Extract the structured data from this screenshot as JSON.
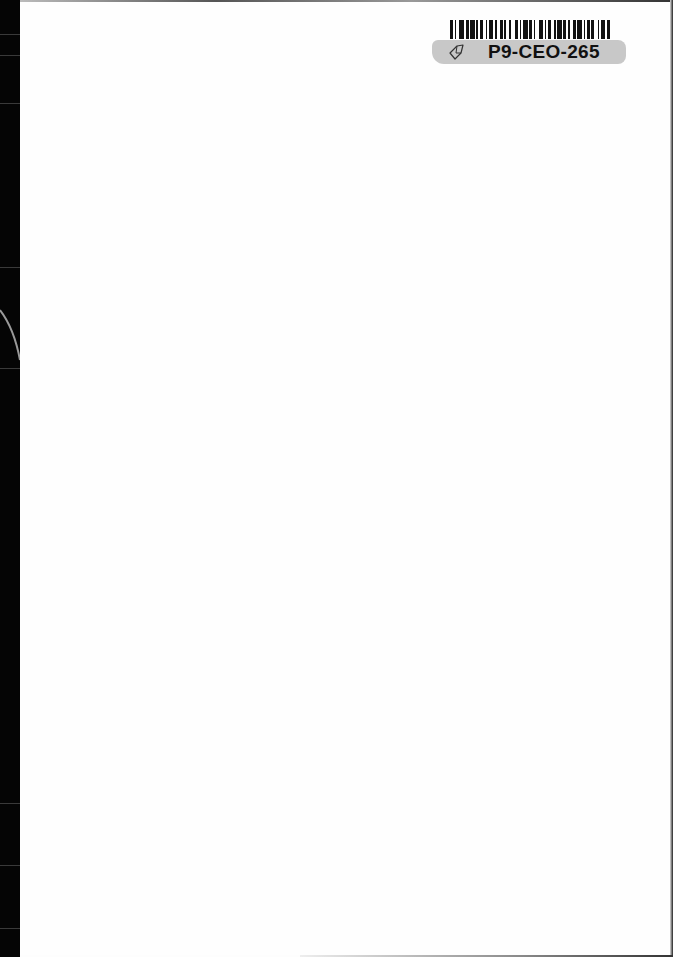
{
  "document": {
    "type": "scanned-blank-page",
    "page_color": "#fefefe",
    "binding_color": "#050505"
  },
  "library_label": {
    "icon": "tag-icon",
    "call_number": "P9-CEO-265",
    "label_color": "#c8c8c8",
    "barcode_pattern": [
      2,
      1,
      1,
      2,
      3,
      1,
      2,
      1,
      3,
      1,
      1,
      1,
      2,
      2,
      1,
      1,
      3,
      1,
      1,
      2,
      2,
      1,
      1,
      2,
      1,
      3,
      2,
      1,
      1,
      1,
      3,
      1,
      2,
      1,
      1,
      2,
      3,
      1,
      1,
      1,
      2,
      2,
      1,
      1,
      3,
      1,
      2,
      1,
      1,
      2,
      2,
      1,
      3,
      1,
      1,
      1,
      2,
      1,
      2,
      2,
      1,
      1,
      3,
      1,
      2,
      1
    ]
  }
}
